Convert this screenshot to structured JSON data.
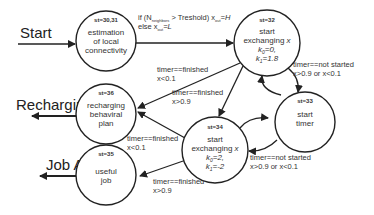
{
  "diagram": {
    "states": [
      {
        "id": "s30_31",
        "st": "st=30,31",
        "lines": [
          "estimation",
          "of local",
          "connectivity"
        ],
        "cx": 106,
        "cy": 41,
        "r": 30
      },
      {
        "id": "s32",
        "st": "st=32",
        "lines": [
          "start",
          "exchanging x",
          "k0=0,",
          "k1=1.8"
        ],
        "cx": 267,
        "cy": 43,
        "r": 33
      },
      {
        "id": "s33",
        "st": "st=33",
        "lines": [
          "start",
          "timer"
        ],
        "cx": 305,
        "cy": 122,
        "r": 30
      },
      {
        "id": "s36",
        "st": "st=36",
        "lines": [
          "recharging",
          "behaviral",
          "plan"
        ],
        "cx": 106,
        "cy": 114,
        "r": 30
      },
      {
        "id": "s34",
        "st": "st=34",
        "lines": [
          "start",
          "exchanging x",
          "k0=2,",
          "k1=-2"
        ],
        "cx": 215,
        "cy": 150,
        "r": 33
      },
      {
        "id": "s35",
        "st": "st=35",
        "lines": [
          "useful",
          "job"
        ],
        "cx": 106,
        "cy": 175,
        "r": 30
      }
    ],
    "external": {
      "start": "Start",
      "recharging": "Recharging",
      "job_a": "Job A"
    },
    "edges": {
      "e1_line1": "if (N",
      "e1_sub": "neighbors",
      "e1_line1b": " > Treshold) x",
      "e1_sub2": "out",
      "e1_line1c": "=H",
      "e1_line2": "else x",
      "e1_line2c": "=L",
      "e32_36_l1": "timer==finished",
      "e32_36_l2": "x<0.1",
      "e32_34_l1": "timer==finished",
      "e32_34_l2": "x>0.9",
      "e32_33_l1": "timer==not started",
      "e32_33_l2": "x>0.9 or  x<0.1",
      "e34_36_l1": "timer==finished",
      "e34_36_l2": "x<0.1",
      "e34_35_l1": "timer==finished",
      "e34_35_l2": "x>0.9",
      "e34_33_l1": "timer==not started",
      "e34_33_l2": "x>0.9 or  x<0.1"
    }
  }
}
